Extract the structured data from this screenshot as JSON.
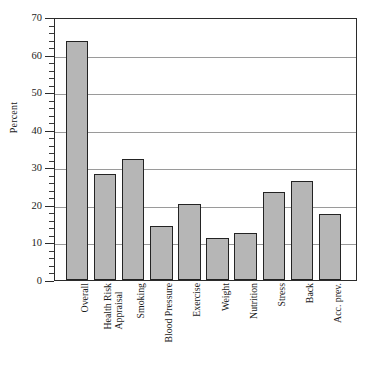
{
  "chart_data": {
    "type": "bar",
    "title": "",
    "subtitle": "",
    "xlabel": "",
    "ylabel": "Percent",
    "ylim": [
      0,
      70
    ],
    "y_major_step": 10,
    "y_minor_step": 2,
    "grid": "horizontal",
    "legend": "none",
    "categories": [
      "Overall",
      "Health Risk\nAppraisal",
      "Smoking",
      "Blood Pressure",
      "Exercise",
      "Weight",
      "Nutrition",
      "Stress",
      "Back",
      "Acc. prev."
    ],
    "values": [
      63.5,
      28.2,
      32.2,
      14.5,
      20.1,
      11.2,
      12.6,
      23.3,
      26.4,
      17.6
    ],
    "ytick_labels": [
      "0",
      "10",
      "20",
      "30",
      "40",
      "50",
      "60",
      "70"
    ],
    "ytick_values": [
      0,
      10,
      20,
      30,
      40,
      50,
      60,
      70
    ],
    "bar_fill_color": "#b6b6b6",
    "bar_edge_color": "#232323",
    "gridline_color": "#9a9a9a",
    "axis_color": "#2b2b2b",
    "background_color": "#ffffff"
  }
}
